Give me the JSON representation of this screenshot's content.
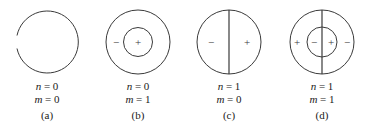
{
  "figure": {
    "background_color": "#ffffff",
    "stroke_color": "#3a3a3a",
    "text_color": "#1a1a1a",
    "panels": [
      {
        "id": "a",
        "sublabel": "(a)",
        "mode_n": "n = 0",
        "mode_m": "m = 0",
        "outer_circle": true,
        "inner_circle": false,
        "diameter_line": false,
        "signs": []
      },
      {
        "id": "b",
        "sublabel": "(b)",
        "mode_n": "n = 0",
        "mode_m": "m = 1",
        "outer_circle": true,
        "inner_circle": true,
        "diameter_line": false,
        "signs": [
          "−",
          "+"
        ]
      },
      {
        "id": "c",
        "sublabel": "(c)",
        "mode_n": "n = 1",
        "mode_m": "m = 0",
        "outer_circle": true,
        "inner_circle": false,
        "diameter_line": true,
        "signs": [
          "−",
          "+"
        ]
      },
      {
        "id": "d",
        "sublabel": "(d)",
        "mode_n": "n = 1",
        "mode_m": "m = 1",
        "outer_circle": true,
        "inner_circle": true,
        "diameter_line": true,
        "signs": [
          "+",
          "−",
          "+",
          "−"
        ]
      }
    ]
  }
}
